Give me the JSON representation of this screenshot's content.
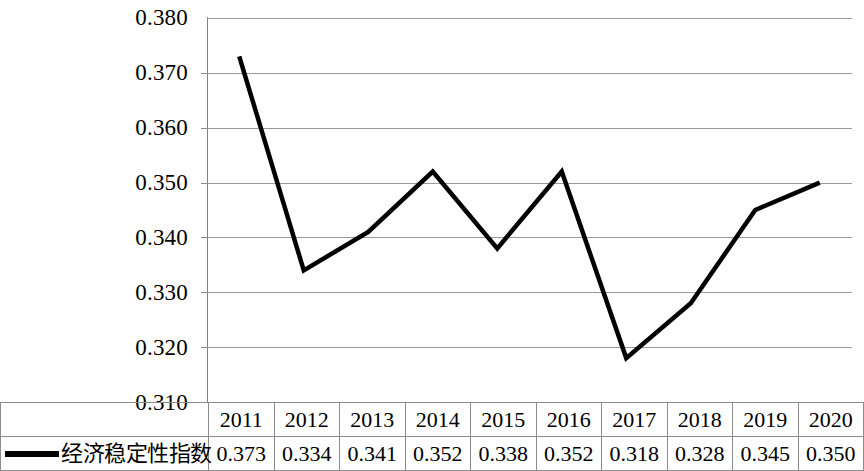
{
  "chart_data": {
    "type": "line",
    "title": "",
    "subtitle": "",
    "xlabel": "",
    "ylabel": "",
    "categories": [
      "2011",
      "2012",
      "2013",
      "2014",
      "2015",
      "2016",
      "2017",
      "2018",
      "2019",
      "2020"
    ],
    "series": [
      {
        "name": "经济稳定性指数",
        "values": [
          0.373,
          0.334,
          0.341,
          0.352,
          0.338,
          0.352,
          0.318,
          0.328,
          0.345,
          0.35
        ],
        "color": "#000000",
        "line_width": 4
      }
    ],
    "value_labels": [
      "0.373",
      "0.334",
      "0.341",
      "0.352",
      "0.338",
      "0.352",
      "0.318",
      "0.328",
      "0.345",
      "0.350"
    ],
    "ylim": [
      0.31,
      0.38
    ],
    "ytick_labels": [
      "0.380",
      "0.370",
      "0.360",
      "0.350",
      "0.340",
      "0.330",
      "0.320",
      "0.310"
    ],
    "ytick_values": [
      0.38,
      0.37,
      0.36,
      0.35,
      0.34,
      0.33,
      0.32,
      0.31
    ],
    "grid": true,
    "grid_color": "#9a9a9a",
    "legend_position": "bottom-left-table",
    "annotations": []
  },
  "legend": {
    "marker": "line-marker",
    "label": "经济稳定性指数"
  },
  "table": {
    "header_row": [
      "2011",
      "2012",
      "2013",
      "2014",
      "2015",
      "2016",
      "2017",
      "2018",
      "2019",
      "2020"
    ],
    "value_row": [
      "0.373",
      "0.334",
      "0.341",
      "0.352",
      "0.338",
      "0.352",
      "0.318",
      "0.328",
      "0.345",
      "0.350"
    ]
  }
}
